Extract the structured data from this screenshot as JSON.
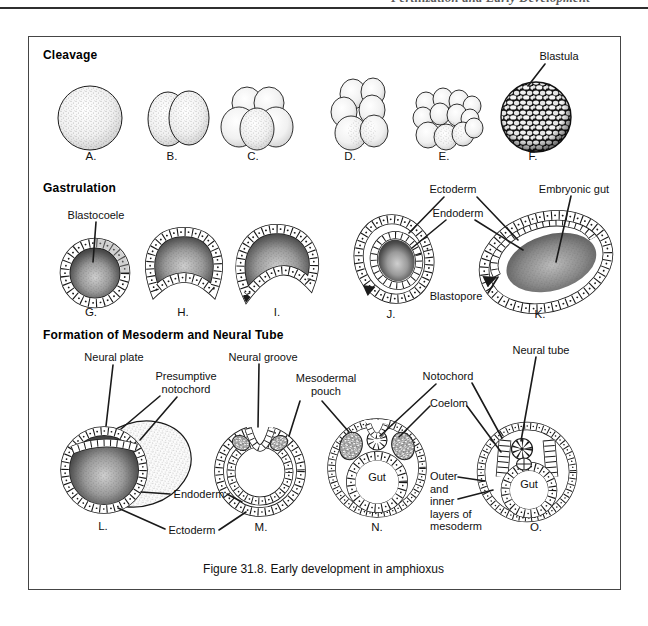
{
  "page": {
    "running_header": "Fertilization and Early Development",
    "caption": "Figure 31.8. Early development in amphioxus"
  },
  "sections": {
    "cleavage": {
      "title": "Cleavage",
      "stages": [
        "A.",
        "B.",
        "C.",
        "D.",
        "E.",
        "F."
      ],
      "labels": {
        "blastula": "Blastula"
      }
    },
    "gastrulation": {
      "title": "Gastrulation",
      "stages": [
        "G.",
        "H.",
        "I.",
        "J.",
        "K."
      ],
      "labels": {
        "blastocoele": "Blastocoele",
        "ectoderm": "Ectoderm",
        "endoderm": "Endoderm",
        "embryonic_gut": "Embryonic gut",
        "blastopore": "Blastopore"
      }
    },
    "mesoderm_neural_tube": {
      "title": "Formation of Mesoderm and Neural Tube",
      "stages": [
        "L.",
        "M.",
        "N.",
        "O."
      ],
      "labels": {
        "neural_plate": "Neural plate",
        "presumptive_notochord": "Presumptive\nnotochord",
        "neural_groove": "Neural groove",
        "mesodermal_pouch": "Mesodermal\npouch",
        "notochord": "Notochord",
        "coelom": "Coelom",
        "neural_tube": "Neural tube",
        "endoderm": "Endoderm",
        "ectoderm": "Ectoderm",
        "gut": "Gut",
        "mesoderm_layers": "Outer\nand\ninner\nlayers of\nmesoderm"
      }
    }
  }
}
